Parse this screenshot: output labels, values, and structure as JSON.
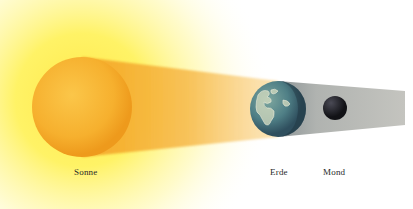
{
  "bodies": {
    "sun": {
      "label": "Sonne",
      "cx": 82,
      "cy": 107,
      "r": 50,
      "color": "#f7b52c"
    },
    "earth": {
      "label": "Erde",
      "cx": 278,
      "cy": 109,
      "r": 28,
      "color": "#4f7f86"
    },
    "moon": {
      "label": "Mond",
      "cx": 335,
      "cy": 108,
      "r": 12,
      "color": "#1e1e24"
    }
  },
  "labels": [
    {
      "key": "sun",
      "text": "Sonne",
      "x": 74,
      "y": 167
    },
    {
      "key": "earth",
      "text": "Erde",
      "x": 270,
      "y": 167
    },
    {
      "key": "moon",
      "text": "Mond",
      "x": 323,
      "y": 167
    }
  ],
  "colors": {
    "glow": "#fff46a",
    "light_beam": "#f5b23a",
    "shadow": "#b9b9b4",
    "background": "#ffffff"
  },
  "shadow_end_x": 405
}
